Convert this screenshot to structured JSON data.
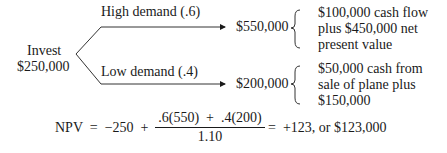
{
  "root": {
    "line1": "Invest",
    "line2": "$250,000"
  },
  "branches": [
    {
      "label": "High demand (.6)",
      "outcome": "$550,000",
      "note": [
        "$100,000 cash flow",
        "plus $450,000 net",
        "present value"
      ]
    },
    {
      "label": "Low demand (.4)",
      "outcome": "$200,000",
      "note": [
        "$50,000 cash from",
        "sale of plane plus",
        "$150,000"
      ]
    }
  ],
  "equation": {
    "lhs": "NPV  =  −250  +",
    "numerator": ".6(550)  +  .4(200)",
    "denominator": "1.10",
    "rhs": "=  +123, or $123,000"
  }
}
